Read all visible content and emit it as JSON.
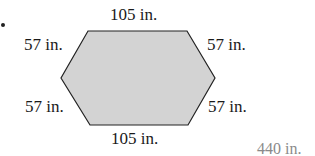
{
  "figure": {
    "shape": "hexagon",
    "fill_color": "#d3d3d3",
    "stroke_color": "#222222",
    "labels": {
      "top": "105 in.",
      "bottom": "105 in.",
      "upper_left": "57 in.",
      "upper_right": "57 in.",
      "lower_left": "57 in.",
      "lower_right": "57 in."
    }
  },
  "answer": "440 in."
}
